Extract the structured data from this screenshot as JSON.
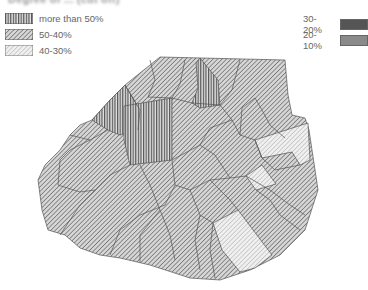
{
  "header": {
    "cut_off_title": "Degree of ... (cut off)"
  },
  "legend": {
    "left": [
      {
        "label": "more than 50%",
        "pattern": "vertical"
      },
      {
        "label": "50-40%",
        "pattern": "dense-diagonal"
      },
      {
        "label": "40-30%",
        "pattern": "light-diagonal"
      }
    ],
    "right": [
      {
        "label": "30-20%",
        "color": "#555555"
      },
      {
        "label": "20-10%",
        "color": "#8a8a8a"
      }
    ]
  },
  "map": {
    "subject": "Paris arrondissements / quartiers choropleth"
  }
}
